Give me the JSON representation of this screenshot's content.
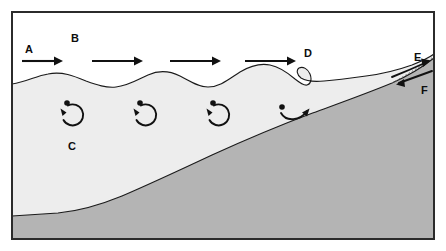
{
  "diagram": {
    "canvas": {
      "width": 446,
      "height": 251
    },
    "colors": {
      "air": "#ffffff",
      "water": "#ededed",
      "seabed": "#b4b4b4",
      "outline": "#1a1a1a",
      "frame": "#2b2b2b",
      "ink": "#111111"
    },
    "frame": {
      "x": 11,
      "y": 11,
      "width": 424,
      "height": 229
    },
    "labels": [
      {
        "id": "A",
        "text": "A",
        "x": 25,
        "y": 44,
        "role": "deep-water-wave-direction"
      },
      {
        "id": "B",
        "text": "B",
        "x": 71,
        "y": 33,
        "role": "deep-water-wave-crest"
      },
      {
        "id": "C",
        "text": "C",
        "x": 68,
        "y": 141,
        "role": "circular-orbital-motion"
      },
      {
        "id": "D",
        "text": "D",
        "x": 304,
        "y": 48,
        "role": "breaking-wave"
      },
      {
        "id": "E",
        "text": "E",
        "x": 414,
        "y": 52,
        "role": "swash"
      },
      {
        "id": "F",
        "text": "F",
        "x": 421,
        "y": 85,
        "role": "backwash"
      }
    ],
    "flow_arrows": [
      {
        "id": "arrow-1",
        "x1": 22,
        "y1": 61,
        "x2": 60,
        "y2": 61
      },
      {
        "id": "arrow-2",
        "x1": 92,
        "y1": 61,
        "x2": 140,
        "y2": 61
      },
      {
        "id": "arrow-3",
        "x1": 170,
        "y1": 61,
        "x2": 218,
        "y2": 61
      },
      {
        "id": "arrow-4",
        "x1": 245,
        "y1": 61,
        "x2": 292,
        "y2": 61
      }
    ],
    "orbitals": [
      {
        "id": "orbit-1",
        "cx": 71,
        "cy": 115,
        "r": 11,
        "dot_x": 67,
        "dot_y": 103,
        "shape": "circle"
      },
      {
        "id": "orbit-2",
        "cx": 144,
        "cy": 115,
        "r": 11,
        "dot_x": 140,
        "dot_y": 103,
        "shape": "circle"
      },
      {
        "id": "orbit-3",
        "cx": 217,
        "cy": 115,
        "r": 11,
        "dot_x": 213,
        "dot_y": 103,
        "shape": "circle"
      },
      {
        "id": "orbit-4",
        "cx": 290,
        "cy": 115,
        "r": 11,
        "dot_x": 282,
        "dot_y": 107,
        "shape": "flattened-ellipse"
      }
    ],
    "water_surface": {
      "description": "Sinusoidal wave train increasing in height shoreward, breaking near x=310",
      "breaker_x": 310,
      "wave_count": 4
    },
    "seabed": {
      "description": "Seabed rising from deep water on the left to the beach on the right",
      "deep_depth_y": 215,
      "shore_contact_x": 432
    },
    "swash_arrows": [
      {
        "id": "swash-uprush",
        "label_ref": "E",
        "direction": "up-slope"
      },
      {
        "id": "backwash-downrush",
        "label_ref": "F",
        "direction": "down-slope"
      }
    ]
  }
}
